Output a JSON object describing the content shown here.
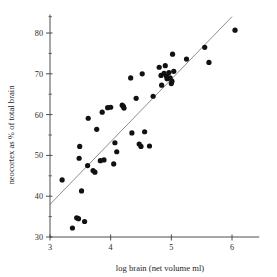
{
  "chart_data": {
    "type": "scatter",
    "title": "",
    "xlabel": "log brain (net volume ml)",
    "ylabel": "neocortex as % of total brain",
    "xlim": [
      2.85,
      6.45
    ],
    "ylim": [
      29.0,
      84.5
    ],
    "xticks": [
      3,
      4,
      5,
      6
    ],
    "xtick_labels": [
      "3",
      "4",
      "5",
      "6"
    ],
    "yticks": [
      30,
      40,
      50,
      60,
      70,
      80
    ],
    "ytick_labels": [
      "30",
      "40",
      "50",
      "60",
      "70",
      "80"
    ],
    "y_minor_ticks": [
      35,
      45,
      55,
      65,
      75
    ],
    "grid": false,
    "legend": false,
    "marker_color": "#111111",
    "fit_line_color": "#7a7a76",
    "axis_color": "#3a3a38",
    "fit_line": {
      "x_start": 3.0,
      "y_start": 38.0,
      "x_end": 6.0,
      "y_end": 84.0,
      "slope": 15.33,
      "intercept": -8.0
    },
    "points": [
      {
        "x": 3.2,
        "y": 44.0
      },
      {
        "x": 3.37,
        "y": 32.2
      },
      {
        "x": 3.44,
        "y": 34.7
      },
      {
        "x": 3.47,
        "y": 34.5
      },
      {
        "x": 3.48,
        "y": 49.3
      },
      {
        "x": 3.49,
        "y": 52.2
      },
      {
        "x": 3.52,
        "y": 41.3
      },
      {
        "x": 3.57,
        "y": 33.8
      },
      {
        "x": 3.62,
        "y": 47.5
      },
      {
        "x": 3.63,
        "y": 59.1
      },
      {
        "x": 3.71,
        "y": 46.3
      },
      {
        "x": 3.74,
        "y": 45.9
      },
      {
        "x": 3.77,
        "y": 56.4
      },
      {
        "x": 3.83,
        "y": 48.7
      },
      {
        "x": 3.86,
        "y": 60.6
      },
      {
        "x": 3.89,
        "y": 48.9
      },
      {
        "x": 3.95,
        "y": 61.7
      },
      {
        "x": 4.0,
        "y": 61.8
      },
      {
        "x": 4.05,
        "y": 47.9
      },
      {
        "x": 4.07,
        "y": 53.1
      },
      {
        "x": 4.1,
        "y": 50.9
      },
      {
        "x": 4.19,
        "y": 62.3
      },
      {
        "x": 4.21,
        "y": 62.0
      },
      {
        "x": 4.22,
        "y": 61.6
      },
      {
        "x": 4.33,
        "y": 69.0
      },
      {
        "x": 4.35,
        "y": 55.5
      },
      {
        "x": 4.42,
        "y": 64.0
      },
      {
        "x": 4.47,
        "y": 52.8
      },
      {
        "x": 4.5,
        "y": 52.2
      },
      {
        "x": 4.52,
        "y": 70.0
      },
      {
        "x": 4.56,
        "y": 55.8
      },
      {
        "x": 4.64,
        "y": 52.3
      },
      {
        "x": 4.7,
        "y": 64.5
      },
      {
        "x": 4.8,
        "y": 71.6
      },
      {
        "x": 4.83,
        "y": 69.6
      },
      {
        "x": 4.84,
        "y": 67.2
      },
      {
        "x": 4.88,
        "y": 70.1
      },
      {
        "x": 4.9,
        "y": 72.0
      },
      {
        "x": 4.92,
        "y": 69.4
      },
      {
        "x": 4.93,
        "y": 68.8
      },
      {
        "x": 4.96,
        "y": 70.3
      },
      {
        "x": 4.98,
        "y": 69.0
      },
      {
        "x": 5.0,
        "y": 67.6
      },
      {
        "x": 5.01,
        "y": 68.2
      },
      {
        "x": 5.02,
        "y": 74.8
      },
      {
        "x": 5.04,
        "y": 70.6
      },
      {
        "x": 5.25,
        "y": 73.6
      },
      {
        "x": 5.55,
        "y": 76.5
      },
      {
        "x": 5.62,
        "y": 72.8
      },
      {
        "x": 6.05,
        "y": 80.7
      }
    ]
  }
}
